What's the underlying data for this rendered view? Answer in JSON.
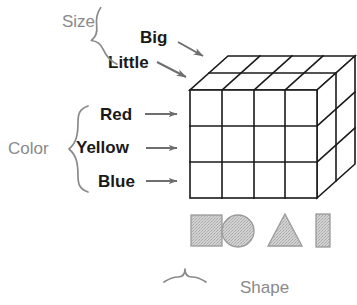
{
  "diagram": {
    "dimensions": {
      "size": {
        "label": "Size",
        "levels": [
          "Big",
          "Little"
        ],
        "brace_orientation": "right-opening",
        "axis": "depth"
      },
      "color": {
        "label": "Color",
        "levels": [
          "Red",
          "Yellow",
          "Blue"
        ],
        "brace_orientation": "right-opening",
        "axis": "vertical"
      },
      "shape": {
        "label": "Shape",
        "levels": [
          "square",
          "circle",
          "triangle",
          "tall-rectangle"
        ],
        "brace_orientation": "up-opening",
        "axis": "horizontal"
      }
    },
    "cube": {
      "columns": 4,
      "rows": 3,
      "depth_layers": 2,
      "total_cells": 24,
      "line_color": "#1a1a1a",
      "face_color": "#ffffff"
    },
    "shape_row": [
      {
        "name": "square",
        "glyph": "square-icon"
      },
      {
        "name": "circle",
        "glyph": "circle-icon"
      },
      {
        "name": "triangle",
        "glyph": "triangle-icon"
      },
      {
        "name": "tall-rectangle",
        "glyph": "rectangle-icon"
      }
    ],
    "colors": {
      "label_gray": "#8a8a8a",
      "label_black": "#1a1a1a",
      "arrow_gray": "#6e6e6e",
      "brace_gray": "#8a8a8a",
      "shape_fill": "#c9c9c9",
      "shape_stroke": "#9a9a9a",
      "cube_stroke": "#1a1a1a"
    },
    "arrows": {
      "big_arrow": "arrow-right-down-icon",
      "little_arrow": "arrow-right-down-icon",
      "red_arrow": "arrow-right-icon",
      "yellow_arrow": "arrow-right-icon",
      "blue_arrow": "arrow-right-icon"
    }
  }
}
